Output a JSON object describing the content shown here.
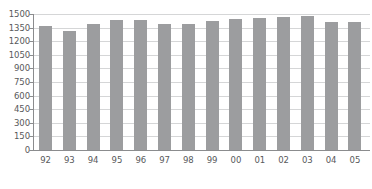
{
  "chart_data": {
    "type": "bar",
    "title": "",
    "subtitle": "",
    "xlabel": "",
    "ylabel": "",
    "categories": [
      "92",
      "93",
      "94",
      "95",
      "96",
      "97",
      "98",
      "99",
      "00",
      "01",
      "02",
      "03",
      "04",
      "05"
    ],
    "values": [
      1365,
      1315,
      1385,
      1435,
      1430,
      1395,
      1390,
      1425,
      1440,
      1455,
      1470,
      1480,
      1410,
      1415
    ],
    "series": [
      {
        "name": "",
        "values": [
          1365,
          1315,
          1385,
          1435,
          1430,
          1395,
          1390,
          1425,
          1440,
          1455,
          1470,
          1480,
          1410,
          1415
        ]
      }
    ],
    "ylim": [
      0,
      1500
    ],
    "yticks": [
      0,
      150,
      300,
      450,
      600,
      750,
      900,
      1050,
      1200,
      1350,
      1500
    ],
    "ytick_labels": [
      "0",
      "150",
      "300",
      "450",
      "600",
      "750",
      "900",
      "1050",
      "1200",
      "1350",
      "1500"
    ],
    "xtick_labels": [
      "92",
      "93",
      "94",
      "95",
      "96",
      "97",
      "98",
      "99",
      "00",
      "01",
      "02",
      "03",
      "04",
      "05"
    ],
    "grid": true,
    "grid_axis": "y",
    "legend": false,
    "legend_position": "none",
    "annotations": [],
    "colors": {
      "bar": "#9c9d9f",
      "grid": "#d5d6d7",
      "axis": "#8b8c8e",
      "text": "#58595b",
      "background": "#ffffff"
    }
  }
}
